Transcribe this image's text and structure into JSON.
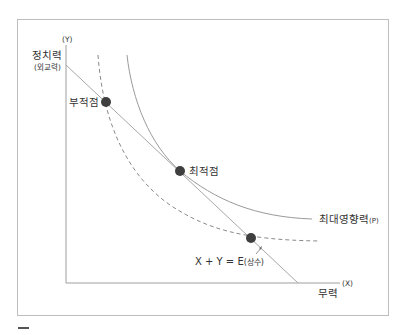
{
  "diagram": {
    "type": "indifference-curve diagram",
    "y_axis": {
      "symbol": "(Y)",
      "label": "정치력",
      "sublabel": "(외교력)"
    },
    "x_axis": {
      "symbol": "(X)",
      "label": "무력"
    },
    "points": [
      {
        "id": "suboptimal",
        "label": "부적점"
      },
      {
        "id": "optimal",
        "label": "최적점"
      },
      {
        "id": "third",
        "label": ""
      }
    ],
    "curves": {
      "max_influence": {
        "label": "최대영향력",
        "suffix": "(P)",
        "style": "solid"
      },
      "lower_influence": {
        "label": "",
        "style": "dashed"
      }
    },
    "budget_line": {
      "equation_main": "X + Y = E",
      "equation_suffix": "(상수)"
    }
  },
  "colors": {
    "frame": "#bdbdbd",
    "axis": "#9e9e9e",
    "line": "#a8a8a8",
    "dot": "#3f3f3f",
    "text": "#333333",
    "dash_mark": "#555555"
  }
}
